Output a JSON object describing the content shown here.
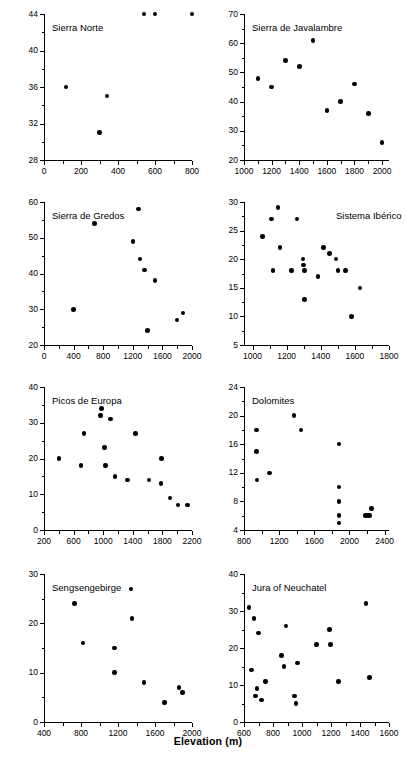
{
  "figure": {
    "ylabel": "Species richness",
    "xlabel": "Elevation (m)",
    "point_color": "#000000",
    "axis_color": "#000000"
  },
  "chart_data": [
    {
      "type": "scatter",
      "title": "Sierra Norte",
      "xlabel": "Elevation (m)",
      "ylabel": "Species richness",
      "xlim": [
        0,
        800
      ],
      "ylim": [
        28,
        44
      ],
      "xticks": [
        0,
        200,
        400,
        600,
        800
      ],
      "yticks": [
        28,
        32,
        36,
        40,
        44
      ],
      "grid": false,
      "x": [
        120,
        300,
        340,
        540,
        600,
        800
      ],
      "y": [
        36,
        31,
        35,
        44,
        44,
        44
      ]
    },
    {
      "type": "scatter",
      "title": "Sierra de Javalambre",
      "xlabel": "Elevation (m)",
      "ylabel": "Species richness",
      "xlim": [
        1000,
        2050
      ],
      "ylim": [
        20,
        70
      ],
      "xticks": [
        1000,
        1200,
        1400,
        1600,
        1800,
        2000
      ],
      "yticks": [
        20,
        30,
        40,
        50,
        60,
        70
      ],
      "grid": false,
      "x": [
        1100,
        1200,
        1300,
        1400,
        1500,
        1600,
        1700,
        1800,
        1900,
        2000
      ],
      "y": [
        48,
        45,
        54,
        52,
        61,
        37,
        40,
        46,
        36,
        26
      ]
    },
    {
      "type": "scatter",
      "title": "Sierra de Gredos",
      "xlabel": "Elevation (m)",
      "ylabel": "Species richness",
      "xlim": [
        0,
        2000
      ],
      "ylim": [
        20,
        60
      ],
      "xticks": [
        0,
        400,
        800,
        1200,
        1600,
        2000
      ],
      "yticks": [
        20,
        30,
        40,
        50,
        60
      ],
      "grid": false,
      "x": [
        400,
        680,
        1200,
        1280,
        1300,
        1360,
        1400,
        1500,
        1800,
        1880
      ],
      "y": [
        30,
        54,
        49,
        58,
        44,
        41,
        24,
        38,
        27,
        29
      ]
    },
    {
      "type": "scatter",
      "title": "Sistema Ibérico",
      "xlabel": "Elevation (m)",
      "ylabel": "Species richness",
      "xlim": [
        950,
        1800
      ],
      "ylim": [
        5,
        30
      ],
      "xticks": [
        1000,
        1200,
        1400,
        1600,
        1800
      ],
      "yticks": [
        5,
        10,
        15,
        20,
        25,
        30
      ],
      "grid": false,
      "x": [
        1060,
        1110,
        1120,
        1150,
        1160,
        1230,
        1260,
        1295,
        1300,
        1305,
        1305,
        1385,
        1415,
        1450,
        1490,
        1500,
        1545,
        1580,
        1630
      ],
      "y": [
        24,
        27,
        18,
        29,
        22,
        18,
        27,
        20,
        19,
        18,
        13,
        17,
        22,
        21,
        20,
        18,
        18,
        10,
        15
      ]
    },
    {
      "type": "scatter",
      "title": "Picos de Europa",
      "xlabel": "Elevation (m)",
      "ylabel": "Species richness",
      "xlim": [
        200,
        2200
      ],
      "ylim": [
        0,
        40
      ],
      "xticks": [
        200,
        600,
        1000,
        1400,
        1800,
        2200
      ],
      "yticks": [
        0,
        10,
        20,
        30,
        40
      ],
      "grid": false,
      "x": [
        400,
        700,
        740,
        960,
        980,
        1020,
        1030,
        1100,
        1160,
        1330,
        1440,
        1620,
        1780,
        1790,
        1900,
        2010,
        2140
      ],
      "y": [
        20,
        18,
        27,
        32,
        34,
        23,
        18,
        31,
        15,
        14,
        27,
        14,
        13,
        20,
        9,
        7,
        7
      ]
    },
    {
      "type": "scatter",
      "title": "Dolomites",
      "xlabel": "Elevation (m)",
      "ylabel": "Species richness",
      "xlim": [
        800,
        2450
      ],
      "ylim": [
        4,
        24
      ],
      "xticks": [
        800,
        1200,
        1600,
        2000,
        2400
      ],
      "yticks": [
        4,
        8,
        12,
        16,
        20,
        24
      ],
      "grid": false,
      "x": [
        940,
        945,
        950,
        1090,
        1370,
        1450,
        1880,
        1880,
        1880,
        1880,
        1880,
        2180,
        2210,
        2230,
        2250
      ],
      "y": [
        18,
        15,
        11,
        12,
        20,
        18,
        16,
        10,
        8,
        6,
        5,
        6,
        6,
        6,
        7
      ]
    },
    {
      "type": "scatter",
      "title": "Sengsengebirge",
      "xlabel": "Elevation (m)",
      "ylabel": "Species richness",
      "xlim": [
        400,
        2000
      ],
      "ylim": [
        0,
        30
      ],
      "xticks": [
        400,
        800,
        1200,
        1600,
        2000
      ],
      "yticks": [
        0,
        10,
        20,
        30
      ],
      "grid": false,
      "x": [
        730,
        820,
        1160,
        1160,
        1340,
        1350,
        1480,
        1700,
        1860,
        1900
      ],
      "y": [
        24,
        16,
        15,
        10,
        27,
        21,
        8,
        4,
        7,
        6
      ]
    },
    {
      "type": "scatter",
      "title": "Jura of Neuchatel",
      "xlabel": "Elevation (m)",
      "ylabel": "Species richness",
      "xlim": [
        600,
        1600
      ],
      "ylim": [
        0,
        40
      ],
      "xticks": [
        600,
        800,
        1000,
        1200,
        1400,
        1600
      ],
      "yticks": [
        0,
        10,
        20,
        30,
        40
      ],
      "grid": false,
      "x": [
        635,
        650,
        670,
        680,
        690,
        700,
        720,
        750,
        860,
        875,
        890,
        950,
        960,
        970,
        1100,
        1190,
        1195,
        1250,
        1440,
        1465
      ],
      "y": [
        31,
        14,
        28,
        7,
        9,
        24,
        6,
        11,
        18,
        15,
        26,
        7,
        5,
        16,
        21,
        25,
        21,
        11,
        32,
        12
      ]
    }
  ]
}
